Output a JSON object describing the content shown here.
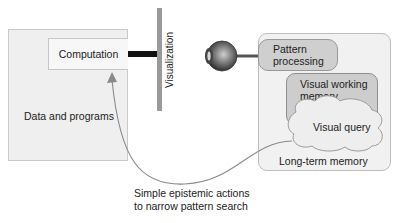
{
  "diagram": {
    "data_box": {
      "label": "Data and programs"
    },
    "computation_box": {
      "label": "Computation"
    },
    "visualization": {
      "label": "Visualization"
    },
    "eye": {
      "icon": "eye-icon"
    },
    "mind_box": {
      "pattern_processing": {
        "line1": "Pattern",
        "line2": "processing"
      },
      "visual_working_memory": {
        "line1": "Visual working",
        "line2": "memory"
      },
      "visual_query": {
        "label": "Visual query"
      },
      "long_term_memory": {
        "label": "Long-term memory"
      }
    },
    "caption": {
      "line1": "Simple epistemic actions",
      "line2": "to narrow pattern search"
    },
    "colors": {
      "box_fill": "#efefef",
      "pattern_fill": "#cfcfcf",
      "vwm_fill": "#cdcdcd",
      "cloud_fill": "#eeeeee",
      "arrow": "#8a8a8a",
      "link": "#111111"
    }
  }
}
